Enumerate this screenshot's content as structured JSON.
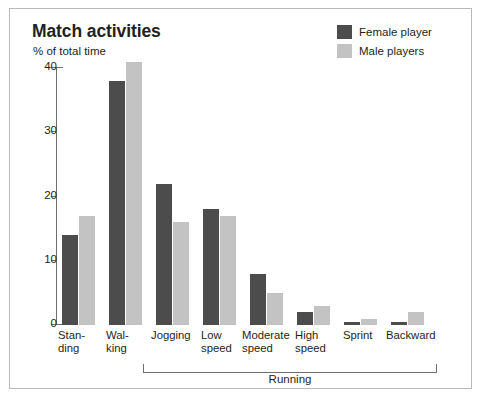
{
  "chart": {
    "title": "Match activities",
    "axis_caption": "% of total time",
    "running_bracket_label": "Running"
  },
  "legend": {
    "items": [
      {
        "label": "Female player",
        "color": "#4c4c4c"
      },
      {
        "label": "Male players",
        "color": "#c3c3c3"
      }
    ]
  },
  "chart_data": {
    "type": "bar",
    "title": "Match activities",
    "xlabel": "",
    "ylabel": "% of total time",
    "ylim": [
      0,
      40
    ],
    "yticks": [
      0,
      10,
      20,
      30,
      40
    ],
    "ytick_labels": [
      "0",
      "10",
      "20",
      "30",
      "40"
    ],
    "grid": false,
    "legend_position": "top-right",
    "categories": [
      "Standing",
      "Walking",
      "Jogging",
      "Low speed",
      "Moderate speed",
      "High speed",
      "Sprint",
      "Backward"
    ],
    "category_labels": [
      "Stan-\nding",
      "Wal-\nking",
      "Jogging",
      "Low\nspeed",
      "Moderate\nspeed",
      "High\nspeed",
      "Sprint",
      "Backward"
    ],
    "series": [
      {
        "name": "Female player",
        "color": "#4c4c4c",
        "values": [
          14,
          38,
          22,
          18,
          8,
          2,
          0.5,
          0.5
        ]
      },
      {
        "name": "Male players",
        "color": "#c3c3c3",
        "values": [
          17,
          41,
          16,
          17,
          5,
          3,
          1,
          2
        ]
      }
    ],
    "annotations": [
      {
        "text": "Running",
        "spans_categories": [
          "Jogging",
          "Low speed",
          "Moderate speed",
          "High speed",
          "Sprint",
          "Backward"
        ]
      }
    ]
  },
  "layout": {
    "group_left_positions": [
      52,
      99,
      146,
      193,
      240,
      287,
      334,
      381
    ],
    "label_left_positions": [
      48,
      96,
      141,
      191,
      232,
      285,
      333,
      376
    ],
    "label_widths": [
      46,
      46,
      54,
      46,
      58,
      46,
      46,
      60
    ],
    "bar_width": 16,
    "y_pixels_per_unit": 6.425
  }
}
